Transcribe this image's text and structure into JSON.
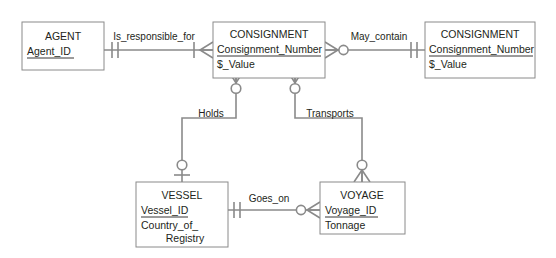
{
  "diagram": {
    "kind": "entity-relationship-diagram",
    "notation": "crows-foot",
    "background_color": "#ffffff",
    "line_color": "#8a8a8a",
    "text_color": "#231f20",
    "entities": [
      {
        "id": "agent",
        "name": "AGENT",
        "attributes": [
          {
            "text": "Agent_ID",
            "key": true
          }
        ]
      },
      {
        "id": "consignment_main",
        "name": "CONSIGNMENT",
        "attributes": [
          {
            "text": "Consignment_Number",
            "key": true
          },
          {
            "text": "$_Value",
            "key": false
          }
        ]
      },
      {
        "id": "consignment_right",
        "name": "CONSIGNMENT",
        "attributes": [
          {
            "text": "Consignment_Number",
            "key": true
          },
          {
            "text": "$_Value",
            "key": false
          }
        ]
      },
      {
        "id": "vessel",
        "name": "VESSEL",
        "attributes": [
          {
            "text": "Vessel_ID",
            "key": true
          },
          {
            "text": "Country_of_",
            "key": false
          },
          {
            "text": "Registry",
            "key": false
          }
        ]
      },
      {
        "id": "voyage",
        "name": "VOYAGE",
        "attributes": [
          {
            "text": "Voyage_ID",
            "key": true
          },
          {
            "text": "Tonnage",
            "key": false
          }
        ]
      }
    ],
    "relationships": [
      {
        "id": "is_responsible_for",
        "label": "Is_responsible_for",
        "from": "agent",
        "to": "consignment_main",
        "from_cardinality": "one-and-only-one",
        "to_cardinality": "one-or-many"
      },
      {
        "id": "may_contain",
        "label": "May_contain",
        "from": "consignment_main",
        "to": "consignment_right",
        "from_cardinality": "zero-or-many",
        "to_cardinality": "one-and-only-one"
      },
      {
        "id": "holds",
        "label": "Holds",
        "from": "consignment_main",
        "to": "vessel",
        "from_cardinality": "zero-or-many",
        "to_cardinality": "zero-or-one"
      },
      {
        "id": "transports",
        "label": "Transports",
        "from": "consignment_main",
        "to": "voyage",
        "from_cardinality": "zero-or-many",
        "to_cardinality": "zero-or-many"
      },
      {
        "id": "goes_on",
        "label": "Goes_on",
        "from": "vessel",
        "to": "voyage",
        "from_cardinality": "one-and-only-one",
        "to_cardinality": "zero-or-many"
      }
    ]
  }
}
